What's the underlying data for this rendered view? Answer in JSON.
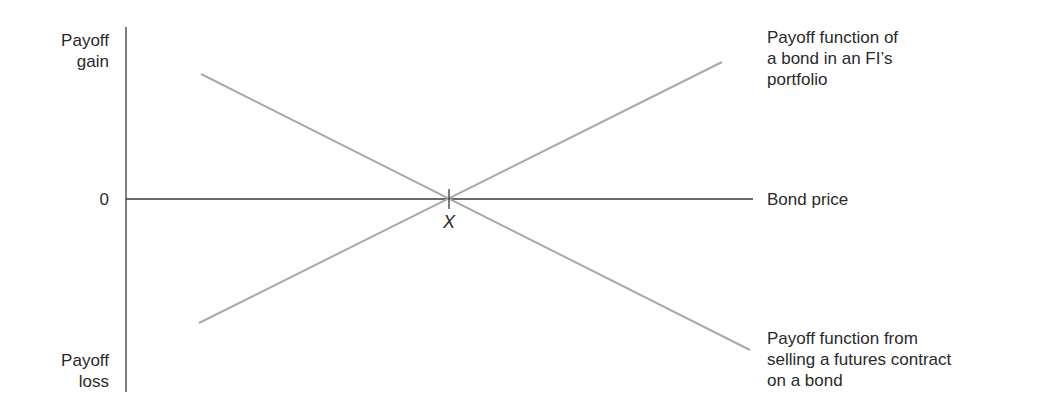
{
  "axes": {
    "y_top_label": [
      "Payoff",
      "gain"
    ],
    "y_bottom_label": [
      "Payoff",
      "loss"
    ],
    "origin_label": "0",
    "x_axis_label": "Bond price",
    "intersection_label": "X"
  },
  "lines": {
    "bond_portfolio": {
      "label": [
        "Payoff function of",
        "a bond in an FI’s",
        "portfolio"
      ],
      "direction": "rising",
      "color": "#a9a9a9"
    },
    "short_futures": {
      "label": [
        "Payoff function from",
        "selling a futures contract",
        "on a bond"
      ],
      "direction": "falling",
      "color": "#a9a9a9"
    }
  },
  "colors": {
    "axis": "#3a3a3a",
    "payoff_lines": "#a9a9a9",
    "text": "#2a2a2a"
  }
}
